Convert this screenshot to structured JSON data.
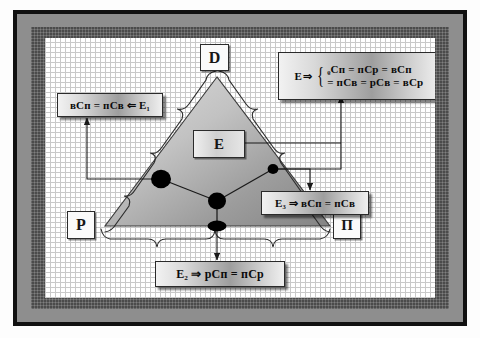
{
  "diagram": {
    "vertices": [
      {
        "id": "top",
        "label": "D"
      },
      {
        "id": "bottom_left",
        "label": "P"
      },
      {
        "id": "bottom_right",
        "label": "П"
      }
    ],
    "center_box": {
      "label": "E"
    },
    "formula_boxes": [
      {
        "id": "top-right",
        "lead": "E",
        "arrow": "⇒",
        "line1": "ᵨCп = пCр = вCп",
        "line2": "= пCв = рCв = вCр",
        "full": "E ⇒ { рCп = пCр = вCп ; = пCв = рCв = вCр }"
      },
      {
        "id": "left",
        "text": "вCп = пCв ⇐ E₁",
        "full": "вCп = пCв ⇐ E1"
      },
      {
        "id": "right",
        "text": "E₃ ⇒ вCп = пCв",
        "full": "E3 ⇒ вCп = пCв"
      },
      {
        "id": "bottom",
        "text": "E₂ ⇒ рCп = пCр",
        "full": "E2 ⇒ рCп = пCр"
      }
    ],
    "nodes": [
      {
        "id": "node-left",
        "position": "left-side-midpoint"
      },
      {
        "id": "node-right",
        "position": "right-side-midpoint"
      },
      {
        "id": "node-center",
        "position": "centroid"
      },
      {
        "id": "node-bottom",
        "position": "base-midpoint"
      }
    ],
    "colors": {
      "frame_black": "#111111",
      "frame_gray": "#8e8e8e",
      "frame_dark": "#4b4b4b",
      "canvas": "#ffffff",
      "grid_line": "#c9c9c9",
      "triangle_light": "#d6d6d6",
      "triangle_dark": "#8a8a8a",
      "node": "#000000",
      "connector": "#1a1a1a"
    }
  }
}
